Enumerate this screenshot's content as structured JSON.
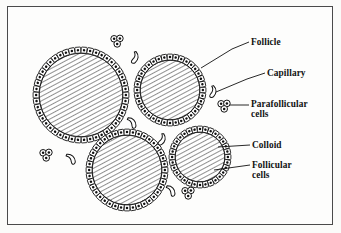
{
  "figure": {
    "frame_color": "#4a4a4a",
    "background_color": "#fdfdfc",
    "ink_color": "#111111"
  },
  "labels": [
    {
      "id": "follicle",
      "text": "Follicle",
      "x": 251,
      "y": 37,
      "leader": [
        [
          201,
          68
        ],
        [
          232,
          49
        ],
        [
          249,
          42
        ]
      ]
    },
    {
      "id": "capillary",
      "text": "Capillary",
      "x": 267,
      "y": 68,
      "leader": [
        [
          216,
          92
        ],
        [
          247,
          79
        ],
        [
          265,
          73
        ]
      ]
    },
    {
      "id": "parafollicular",
      "text": "Parafollicular",
      "x": 251,
      "y": 99,
      "line2": "cells",
      "leader": [
        [
          230,
          105
        ],
        [
          249,
          105
        ]
      ]
    },
    {
      "id": "colloid",
      "text": "Colloid",
      "x": 252,
      "y": 140,
      "leader": [
        [
          218,
          147
        ],
        [
          250,
          145
        ]
      ]
    },
    {
      "id": "follicular",
      "text": "Follicular",
      "x": 252,
      "y": 160,
      "line2": "cells",
      "leader": [
        [
          214,
          170
        ],
        [
          250,
          165
        ]
      ]
    }
  ],
  "follicles": [
    {
      "id": "follicle-large-left",
      "cx": 81,
      "cy": 95,
      "r": 48,
      "cells": 46
    },
    {
      "id": "follicle-top-right",
      "cx": 170,
      "cy": 90,
      "r": 36,
      "cells": 36
    },
    {
      "id": "follicle-bottom-left",
      "cx": 127,
      "cy": 170,
      "r": 41,
      "cells": 40
    },
    {
      "id": "follicle-bottom-right",
      "cx": 200,
      "cy": 157,
      "r": 31,
      "cells": 32
    }
  ],
  "parafollicular_clusters": [
    {
      "id": "cluster-top",
      "cx": 117,
      "cy": 41
    },
    {
      "id": "cluster-right",
      "cx": 224,
      "cy": 106
    },
    {
      "id": "cluster-left",
      "cx": 46,
      "cy": 155
    },
    {
      "id": "cluster-bottom",
      "cx": 188,
      "cy": 193
    }
  ],
  "capillaries": [
    {
      "id": "capillary-top",
      "cx": 136,
      "cy": 58,
      "rot": 15
    },
    {
      "id": "capillary-mid-right",
      "cx": 214,
      "cy": 92,
      "rot": 10
    },
    {
      "id": "capillary-mid-left",
      "cx": 133,
      "cy": 122,
      "rot": -35
    },
    {
      "id": "capillary-center",
      "cx": 163,
      "cy": 140,
      "rot": 20
    },
    {
      "id": "capillary-left",
      "cx": 72,
      "cy": 158,
      "rot": -40
    },
    {
      "id": "capillary-bottom",
      "cx": 172,
      "cy": 190,
      "rot": -35
    }
  ],
  "legend_note": {
    "colloid_fill": "diagonal-hatch",
    "follicular_cells": "ring-of-square-cells-with-nuclei",
    "parafollicular_cells": "clusters-of-three-round-cells"
  }
}
